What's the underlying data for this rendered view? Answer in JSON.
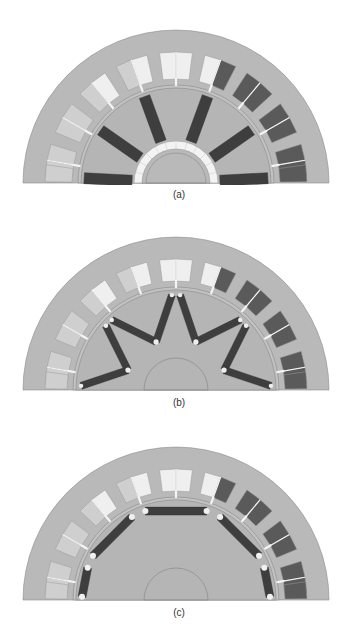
{
  "page": {
    "running_header": "MACHINE TOPOLOGIES OF PERMANENT MAGNET ELECTRIC MACHINES"
  },
  "colors": {
    "iron": "#b9b9b9",
    "iron_edge": "#8a8a8a",
    "magnet": "#3e3e3e",
    "slot_light": "#efefef",
    "slot_mid": "#cfcfcf",
    "slot_dark": "#5a5a5a",
    "background": "#ffffff"
  },
  "figures": [
    {
      "id": "a",
      "caption": "(a)",
      "rotor_type": "spoke-type magnets with non-magnetic hub",
      "top": 22,
      "baseline": 161
    },
    {
      "id": "b",
      "caption": "(b)",
      "rotor_type": "V-shaped interior magnets",
      "top": 224,
      "baseline": 166
    },
    {
      "id": "c",
      "caption": "(c)",
      "rotor_type": "surface-inset tangential magnets",
      "top": 434,
      "baseline": 166
    }
  ]
}
